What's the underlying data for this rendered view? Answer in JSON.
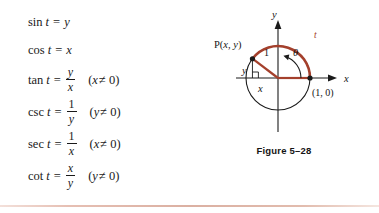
{
  "formulas": [
    {
      "name": "sin",
      "variable": "t",
      "equals": "=",
      "rhs_type": "plain",
      "rhs": "y",
      "condition": ""
    },
    {
      "name": "cos",
      "variable": "t",
      "equals": "=",
      "rhs_type": "plain",
      "rhs": "x",
      "condition": ""
    },
    {
      "name": "tan",
      "variable": "t",
      "equals": "=",
      "rhs_type": "fraction",
      "numerator": "y",
      "denominator": "x",
      "condition": "(x ≠ 0)",
      "cond_var": "x",
      "cond_rest": "≠ 0)"
    },
    {
      "name": "csc",
      "variable": "t",
      "equals": "=",
      "rhs_type": "fraction",
      "numerator": "1",
      "denominator": "y",
      "condition": "(y ≠ 0)",
      "cond_var": "y",
      "cond_rest": "≠ 0)"
    },
    {
      "name": "sec",
      "variable": "t",
      "equals": "=",
      "rhs_type": "fraction",
      "numerator": "1",
      "denominator": "x",
      "condition": "(x ≠ 0)",
      "cond_var": "x",
      "cond_rest": "≠ 0)"
    },
    {
      "name": "cot",
      "variable": "t",
      "equals": "=",
      "rhs_type": "fraction",
      "numerator": "x",
      "denominator": "y",
      "condition": "(y ≠ 0)",
      "cond_var": "y",
      "cond_rest": "≠ 0)"
    }
  ],
  "figure": {
    "caption": "Figure 5–28",
    "axis_x_label": "x",
    "axis_y_label": "y",
    "point_p_label_prefix": "P(",
    "point_p_label": "P(x, y)",
    "point_p_x": "x",
    "point_p_comma": ", ",
    "point_p_y": "y",
    "point_p_close": ")",
    "point_unit_label": "(1, 0)",
    "radius_label": "1",
    "leg_vertical_label": "y",
    "leg_horizontal_label": "x",
    "angle_label": "θ",
    "arc_label": "t",
    "colors": {
      "arc_red": "#a4402c",
      "radius_red": "#a4402c",
      "axis_black": "#1a1a1a",
      "circle_black": "#1a1a1a",
      "text_black": "#161616",
      "bottom_rule": "#dbb0a2"
    },
    "geometry": {
      "center_x": 82,
      "center_y": 74,
      "radius": 32,
      "point_p_angle_deg": 143,
      "unit_point_angle_deg": 0
    }
  }
}
